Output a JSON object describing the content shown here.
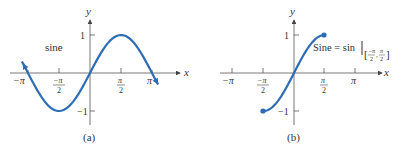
{
  "chart_data": [
    {
      "type": "line",
      "panel": "(a)",
      "title": "",
      "annotation": "sine",
      "xlabel": "x",
      "ylabel": "y",
      "x_ticks": [
        "−π",
        "−π/2",
        "π/2",
        "π"
      ],
      "y_ticks": [
        "1",
        "−1"
      ],
      "xlim": [
        -3.5,
        3.9
      ],
      "ylim": [
        -1.2,
        1.4
      ],
      "function": "sin(x)",
      "domain": [
        -3.45,
        3.45
      ],
      "endpoints": "arrows",
      "color": "#2e6db3"
    },
    {
      "type": "line",
      "panel": "(b)",
      "title": "",
      "annotation": "Sine = sin | [−π/2, π/2]",
      "xlabel": "x",
      "ylabel": "y",
      "x_ticks": [
        "−π",
        "−π/2",
        "π/2",
        "π"
      ],
      "y_ticks": [
        "1",
        "−1"
      ],
      "xlim": [
        -3.5,
        4.0
      ],
      "ylim": [
        -1.2,
        1.4
      ],
      "function": "sin(x)",
      "domain": [
        -1.5708,
        1.5708
      ],
      "endpoints": "closed dots",
      "color": "#2e6db3"
    }
  ],
  "panels": {
    "a": {
      "caption": "(a)",
      "annotation": "sine",
      "xlabel": "x",
      "ylabel": "y",
      "tick_neg_pi": "−π",
      "tick_pi": "π",
      "tick_pi_num": "π",
      "tick_neg_pi_num": "−π",
      "tick_den": "2",
      "y1": "1",
      "yneg1": "−1"
    },
    "b": {
      "caption": "(b)",
      "annotation_left": "Sine = sin",
      "xlabel": "x",
      "ylabel": "y",
      "tick_neg_pi": "−π",
      "tick_pi": "π",
      "tick_pi_num": "π",
      "tick_neg_pi_num": "−π",
      "tick_den": "2",
      "y1": "1",
      "yneg1": "−1",
      "interval_neg_num": "−π",
      "interval_pos_num": "π",
      "interval_den": "2"
    }
  }
}
